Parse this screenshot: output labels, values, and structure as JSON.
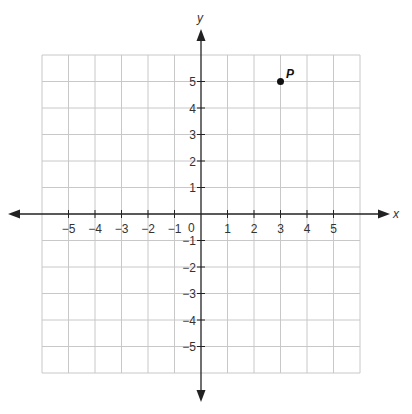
{
  "chart_data": {
    "type": "scatter",
    "title": "",
    "xlabel": "x",
    "ylabel": "y",
    "xlim": [
      -6,
      6
    ],
    "ylim": [
      -6,
      6
    ],
    "grid": true,
    "x_ticks": [
      "-5",
      "-4",
      "-3",
      "-2",
      "-1",
      "1",
      "2",
      "3",
      "4",
      "5"
    ],
    "y_ticks": [
      "5",
      "4",
      "3",
      "2",
      "1",
      "-1",
      "-2",
      "-3",
      "-4",
      "-5"
    ],
    "origin_label": "0",
    "points": [
      {
        "label": "P",
        "x": 3,
        "y": 5
      }
    ]
  },
  "labels": {
    "x_axis": "x",
    "y_axis": "y",
    "origin": "0",
    "point": "P",
    "x_ticks": [
      "−5",
      "−4",
      "−3",
      "−2",
      "−1",
      "1",
      "2",
      "3",
      "4",
      "5"
    ],
    "y_ticks": [
      "5",
      "4",
      "3",
      "2",
      "1",
      "−1",
      "−2",
      "−3",
      "−4",
      "−5"
    ]
  },
  "colors": {
    "grid": "#c8c8c8",
    "axis": "#222222",
    "point": "#111111"
  }
}
